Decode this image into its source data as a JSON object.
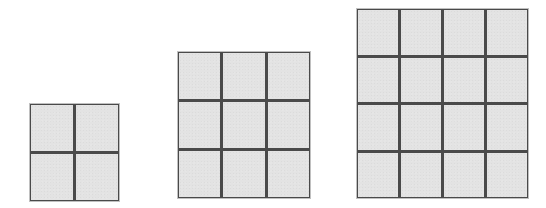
{
  "diagram": {
    "colors": {
      "background": "#ffffff",
      "cell_fill": "#e3e3e3",
      "grid_line": "#4a4a4a"
    },
    "grids": [
      {
        "id": "grid-2x2",
        "rows": 2,
        "cols": 2,
        "cell_count": 4,
        "x": 30,
        "y": 104,
        "width": 89,
        "height": 97
      },
      {
        "id": "grid-3x3",
        "rows": 3,
        "cols": 3,
        "cell_count": 9,
        "x": 178,
        "y": 52,
        "width": 132,
        "height": 146
      },
      {
        "id": "grid-4x4",
        "rows": 4,
        "cols": 4,
        "cell_count": 16,
        "x": 357,
        "y": 9,
        "width": 171,
        "height": 189
      }
    ]
  }
}
